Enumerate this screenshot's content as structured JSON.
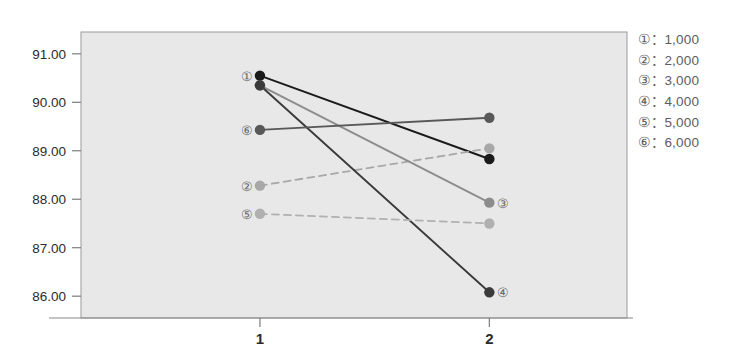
{
  "chart_data": {
    "type": "line",
    "title": "",
    "xlabel": "",
    "ylabel": "",
    "x": [
      1,
      2
    ],
    "xtick_labels": [
      "1",
      "2"
    ],
    "ytick_labels": [
      "91.00",
      "90.00",
      "89.00",
      "88.00",
      "87.00",
      "86.00"
    ],
    "yticks": [
      91.0,
      90.0,
      89.0,
      88.0,
      87.0,
      86.0
    ],
    "ylim": [
      85.55,
      91.45
    ],
    "xlim": [
      0.22,
      2.6
    ],
    "grid": false,
    "legend_position": "right",
    "plot_bgcolor": "#e8e8e8",
    "series": [
      {
        "name": "①",
        "legend_label": "①：1,000",
        "value_label": "1,000",
        "values": [
          90.55,
          88.83
        ],
        "color": "#1a1a1a",
        "style": "solid",
        "start_label": "①",
        "end_label": ""
      },
      {
        "name": "②",
        "legend_label": "②：2,000",
        "value_label": "2,000",
        "values": [
          88.28,
          89.05
        ],
        "color": "#a8a8a8",
        "style": "dashed",
        "start_label": "②",
        "end_label": ""
      },
      {
        "name": "③",
        "legend_label": "③：3,000",
        "value_label": "3,000",
        "values": [
          90.35,
          87.93
        ],
        "color": "#8c8c8c",
        "style": "solid",
        "start_label": "",
        "end_label": "③"
      },
      {
        "name": "④",
        "legend_label": "④：4,000",
        "value_label": "4,000",
        "values": [
          90.35,
          86.08
        ],
        "color": "#3a3a3a",
        "style": "solid",
        "start_label": "",
        "end_label": "④"
      },
      {
        "name": "⑤",
        "legend_label": "⑤：5,000",
        "value_label": "5,000",
        "values": [
          87.7,
          87.5
        ],
        "color": "#b0b0b0",
        "style": "dashed",
        "start_label": "⑤",
        "end_label": ""
      },
      {
        "name": "⑥",
        "legend_label": "⑥：6,000",
        "value_label": "6,000",
        "values": [
          89.43,
          89.68
        ],
        "color": "#585858",
        "style": "solid",
        "start_label": "⑥",
        "end_label": ""
      }
    ]
  },
  "legend": {
    "items": [
      {
        "symbol": "①：",
        "value": "1,000"
      },
      {
        "symbol": "②：",
        "value": "2,000"
      },
      {
        "symbol": "③：",
        "value": "3,000"
      },
      {
        "symbol": "④：",
        "value": "4,000"
      },
      {
        "symbol": "⑤：",
        "value": "5,000"
      },
      {
        "symbol": "⑥：",
        "value": "6,000"
      }
    ]
  }
}
